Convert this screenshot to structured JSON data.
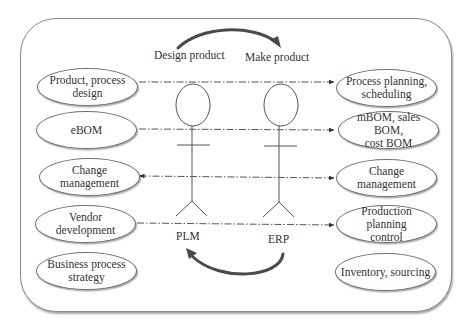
{
  "diagram": {
    "top_flow": {
      "left_label": "Design product",
      "right_label": "Make product"
    },
    "actors": {
      "left": "PLM",
      "right": "ERP"
    },
    "left_nodes": [
      "Product, process\ndesign",
      "eBOM",
      "Change management",
      "Vendor development",
      "Business process\nstrategy"
    ],
    "right_nodes": [
      "Process planning,\nscheduling",
      "mBOM, sales BOM,\ncost BOM",
      "Change management",
      "Production planning\ncontrol",
      "Inventory, sourcing"
    ],
    "connections": [
      {
        "from": "Product, process design",
        "to": "Process planning, scheduling",
        "direction": "left-to-right"
      },
      {
        "from": "eBOM",
        "to": "mBOM, sales BOM, cost BOM",
        "direction": "left-to-right"
      },
      {
        "from": "Change management",
        "to": "Change management",
        "direction": "bidirectional"
      },
      {
        "from": "Vendor development",
        "to": "Production planning control",
        "direction": "left-to-right"
      }
    ],
    "colors": {
      "line": "#555555",
      "frame": "#8a8a8a",
      "arc": "#4a4a4a"
    }
  }
}
